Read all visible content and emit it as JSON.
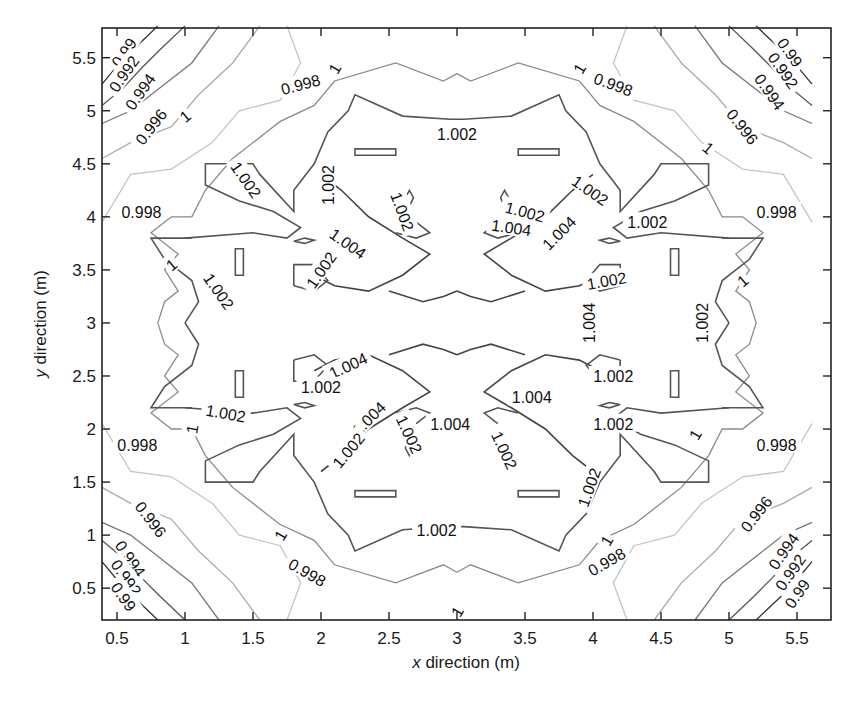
{
  "chart_data": {
    "type": "contour",
    "title": "",
    "xlabel_var": "x",
    "xlabel_rest": " direction (m)",
    "ylabel_var": "y",
    "ylabel_rest": " direction (m)",
    "xlim": [
      0.39,
      5.75
    ],
    "ylim": [
      0.2,
      5.78
    ],
    "x_ticks": [
      0.5,
      1,
      1.5,
      2,
      2.5,
      3,
      3.5,
      4,
      4.5,
      5,
      5.5
    ],
    "x_tick_labels": [
      "0.5",
      "1",
      "1.5",
      "2",
      "2.5",
      "3",
      "3.5",
      "4",
      "4.5",
      "5",
      "5.5"
    ],
    "y_ticks": [
      0.5,
      1,
      1.5,
      2,
      2.5,
      3,
      3.5,
      4,
      4.5,
      5,
      5.5
    ],
    "y_tick_labels": [
      "0.5",
      "1",
      "1.5",
      "2",
      "2.5",
      "3",
      "3.5",
      "4",
      "4.5",
      "5",
      "5.5"
    ],
    "grid": false,
    "legend": "none",
    "contour_levels": [
      0.99,
      0.992,
      0.994,
      0.996,
      0.998,
      1,
      1.002,
      1.004
    ],
    "level_colors": {
      "0.99": "#333333",
      "0.992": "#555555",
      "0.994": "#777777",
      "0.996": "#aaaaaa",
      "0.998": "#c4c4c4",
      "1": "#8a8a8a",
      "1.002": "#555555",
      "1.004": "#444444"
    },
    "symmetry": "fourfold symmetric about (3, 3)",
    "contour_labels": [
      {
        "text": "0.99",
        "x": 0.55,
        "y": 5.55,
        "rot": -55
      },
      {
        "text": "0.992",
        "x": 0.55,
        "y": 5.35,
        "rot": -55
      },
      {
        "text": "0.994",
        "x": 0.67,
        "y": 5.18,
        "rot": -55
      },
      {
        "text": "0.996",
        "x": 0.75,
        "y": 4.85,
        "rot": -52
      },
      {
        "text": "1",
        "x": 1.0,
        "y": 4.95,
        "rot": -40
      },
      {
        "text": "0.998",
        "x": 0.68,
        "y": 4.05,
        "rot": 0
      },
      {
        "text": "0.998",
        "x": 1.85,
        "y": 5.25,
        "rot": -15
      },
      {
        "text": "1",
        "x": 2.1,
        "y": 5.4,
        "rot": -60
      },
      {
        "text": "1.002",
        "x": 3.0,
        "y": 4.78,
        "rot": 0
      },
      {
        "text": "1",
        "x": 3.9,
        "y": 5.4,
        "rot": -60
      },
      {
        "text": "0.998",
        "x": 4.15,
        "y": 5.25,
        "rot": 20
      },
      {
        "text": "0.99",
        "x": 5.45,
        "y": 5.55,
        "rot": 55
      },
      {
        "text": "0.992",
        "x": 5.4,
        "y": 5.38,
        "rot": 55
      },
      {
        "text": "0.994",
        "x": 5.3,
        "y": 5.18,
        "rot": 55
      },
      {
        "text": "0.996",
        "x": 5.1,
        "y": 4.85,
        "rot": 52
      },
      {
        "text": "1",
        "x": 4.85,
        "y": 4.65,
        "rot": 40
      },
      {
        "text": "0.998",
        "x": 5.35,
        "y": 4.05,
        "rot": 0
      },
      {
        "text": "1.002",
        "x": 1.45,
        "y": 4.35,
        "rot": 55
      },
      {
        "text": "1.002",
        "x": 2.05,
        "y": 4.3,
        "rot": -90
      },
      {
        "text": "1.002",
        "x": 2.6,
        "y": 4.05,
        "rot": 70
      },
      {
        "text": "1.004",
        "x": 2.2,
        "y": 3.75,
        "rot": 35
      },
      {
        "text": "1.002",
        "x": 2.0,
        "y": 3.5,
        "rot": -55
      },
      {
        "text": "1.002",
        "x": 3.5,
        "y": 4.05,
        "rot": 15
      },
      {
        "text": "1.004",
        "x": 3.4,
        "y": 3.9,
        "rot": 8
      },
      {
        "text": "1.004",
        "x": 3.75,
        "y": 3.85,
        "rot": -45
      },
      {
        "text": "1.002",
        "x": 3.98,
        "y": 4.25,
        "rot": 35
      },
      {
        "text": "1.002",
        "x": 4.4,
        "y": 3.95,
        "rot": 0
      },
      {
        "text": "1.002",
        "x": 4.1,
        "y": 3.4,
        "rot": -10
      },
      {
        "text": "1",
        "x": 0.9,
        "y": 3.55,
        "rot": -40
      },
      {
        "text": "1.002",
        "x": 1.25,
        "y": 3.3,
        "rot": 55
      },
      {
        "text": "1",
        "x": 5.1,
        "y": 3.4,
        "rot": -40
      },
      {
        "text": "1.002",
        "x": 4.8,
        "y": 3.0,
        "rot": -90
      },
      {
        "text": "1.004",
        "x": 3.97,
        "y": 3.0,
        "rot": -90
      },
      {
        "text": "1.004",
        "x": 2.2,
        "y": 2.6,
        "rot": -25
      },
      {
        "text": "1.002",
        "x": 2.0,
        "y": 2.4,
        "rot": 0
      },
      {
        "text": "1.002",
        "x": 1.3,
        "y": 2.15,
        "rot": 10
      },
      {
        "text": "1",
        "x": 1.05,
        "y": 2.0,
        "rot": -80
      },
      {
        "text": "0.998",
        "x": 0.65,
        "y": 1.85,
        "rot": 0
      },
      {
        "text": "1.004",
        "x": 2.35,
        "y": 2.1,
        "rot": -45
      },
      {
        "text": "1.002",
        "x": 2.2,
        "y": 1.8,
        "rot": -50
      },
      {
        "text": "1.002",
        "x": 2.65,
        "y": 1.95,
        "rot": 65
      },
      {
        "text": "1.004",
        "x": 2.95,
        "y": 2.05,
        "rot": 0
      },
      {
        "text": "1.002",
        "x": 3.35,
        "y": 1.8,
        "rot": 65
      },
      {
        "text": "1.004",
        "x": 3.55,
        "y": 2.3,
        "rot": 0
      },
      {
        "text": "1.002",
        "x": 4.15,
        "y": 2.5,
        "rot": 0
      },
      {
        "text": "1.002",
        "x": 4.15,
        "y": 2.05,
        "rot": 0
      },
      {
        "text": "1.002",
        "x": 3.97,
        "y": 1.45,
        "rot": -70
      },
      {
        "text": "1",
        "x": 4.75,
        "y": 1.95,
        "rot": -60
      },
      {
        "text": "0.998",
        "x": 5.35,
        "y": 1.85,
        "rot": 0
      },
      {
        "text": "0.996",
        "x": 0.75,
        "y": 1.15,
        "rot": 52
      },
      {
        "text": "0.994",
        "x": 0.6,
        "y": 0.78,
        "rot": 55
      },
      {
        "text": "0.992",
        "x": 0.57,
        "y": 0.6,
        "rot": 55
      },
      {
        "text": "0.99",
        "x": 0.55,
        "y": 0.42,
        "rot": 55
      },
      {
        "text": "1",
        "x": 1.7,
        "y": 1.0,
        "rot": -60
      },
      {
        "text": "0.998",
        "x": 1.9,
        "y": 0.65,
        "rot": 30
      },
      {
        "text": "1.002",
        "x": 2.85,
        "y": 1.05,
        "rot": 0
      },
      {
        "text": "1",
        "x": 3.0,
        "y": 0.28,
        "rot": -60
      },
      {
        "text": "1",
        "x": 4.1,
        "y": 0.95,
        "rot": -60
      },
      {
        "text": "0.998",
        "x": 4.1,
        "y": 0.75,
        "rot": -30
      },
      {
        "text": "0.996",
        "x": 5.2,
        "y": 1.2,
        "rot": -52
      },
      {
        "text": "0.994",
        "x": 5.4,
        "y": 0.85,
        "rot": -55
      },
      {
        "text": "0.992",
        "x": 5.45,
        "y": 0.65,
        "rot": -55
      },
      {
        "text": "0.99",
        "x": 5.5,
        "y": 0.45,
        "rot": -55
      }
    ]
  }
}
